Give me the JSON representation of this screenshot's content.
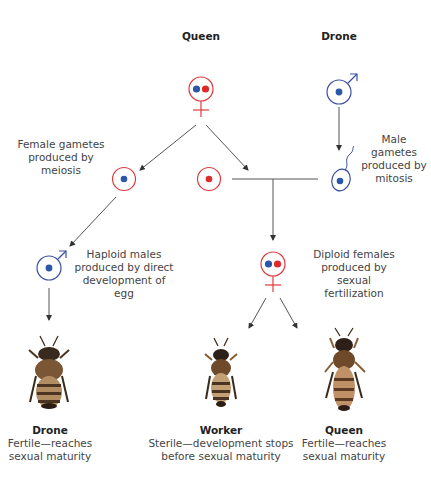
{
  "colors": {
    "female": "#e0393b",
    "male": "#3b4fa0",
    "maternal_dot": "#2a57a8",
    "paternal_dot": "#de2a2a",
    "line": "#555555",
    "text": "#444444"
  },
  "top": {
    "queen_title": "Queen",
    "drone_title": "Drone"
  },
  "gametes": {
    "female_label": [
      "Female gametes",
      "produced by",
      "meiosis"
    ],
    "male_label": [
      "Male gametes",
      "produced by",
      "mitosis"
    ]
  },
  "offspring": {
    "haploid_label": [
      "Haploid males",
      "produced by direct",
      "development of egg"
    ],
    "diploid_label": [
      "Diploid females",
      "produced by sexual",
      "fertilization"
    ]
  },
  "bees": [
    {
      "name": "Drone",
      "line1": "Fertile—reaches",
      "line2": "sexual maturity"
    },
    {
      "name": "Worker",
      "line1": "Sterile—development stops",
      "line2": "before sexual maturity"
    },
    {
      "name": "Queen",
      "line1": "Fertile—reaches",
      "line2": "sexual maturity"
    }
  ]
}
